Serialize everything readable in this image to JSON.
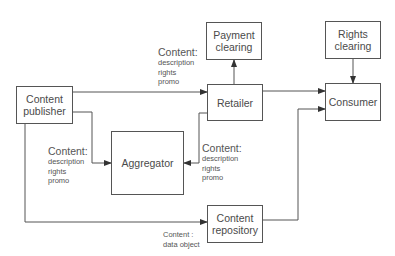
{
  "nodes": {
    "content_publisher": "Content\npublisher",
    "payment_clearing": "Payment\nclearing",
    "retailer": "Retailer",
    "rights_clearing": "Rights\nclearing",
    "consumer": "Consumer",
    "aggregator": "Aggregator",
    "content_repository": "Content\nrepository"
  },
  "labels": {
    "publisher_to_retailer": {
      "head": "Content:",
      "lines": [
        "description",
        "rights",
        "promo"
      ]
    },
    "publisher_to_aggregator": {
      "head": "Content:",
      "lines": [
        "description",
        "rights",
        "promo"
      ]
    },
    "retailer_to_aggregator": {
      "head": "Content:",
      "lines": [
        "description",
        "rights",
        "promo"
      ]
    },
    "publisher_to_repository": {
      "lines": [
        "Content :",
        "data object"
      ]
    }
  },
  "edges": [
    {
      "from": "content_publisher",
      "to": "retailer"
    },
    {
      "from": "content_publisher",
      "to": "aggregator"
    },
    {
      "from": "content_publisher",
      "to": "content_repository"
    },
    {
      "from": "retailer",
      "to": "payment_clearing"
    },
    {
      "from": "retailer",
      "to": "consumer"
    },
    {
      "from": "retailer",
      "to": "aggregator"
    },
    {
      "from": "rights_clearing",
      "to": "consumer"
    },
    {
      "from": "content_repository",
      "to": "consumer"
    }
  ],
  "colors": {
    "stroke": "#555555",
    "text": "#444444",
    "background": "#ffffff"
  }
}
